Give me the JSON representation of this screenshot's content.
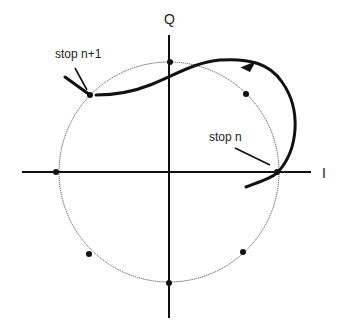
{
  "diagram": {
    "type": "IQ constellation with transition trajectory",
    "axes": {
      "horizontal_label": "I",
      "vertical_label": "Q"
    },
    "annotations": {
      "stop_start": "stop n",
      "stop_end": "stop n+1"
    },
    "constellation_points": 8,
    "colors": {
      "axis": "#111111",
      "circle": "#555555",
      "trajectory": "#111111",
      "points": "#111111"
    }
  }
}
